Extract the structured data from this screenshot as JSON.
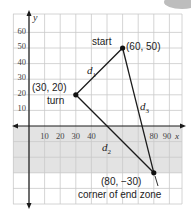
{
  "diagram": {
    "axes": {
      "x_label": "x",
      "y_label": "y",
      "x_ticks": [
        "10",
        "20",
        "30",
        "40",
        "80",
        "90"
      ],
      "y_ticks": [
        "10",
        "20",
        "30",
        "40",
        "50",
        "60"
      ]
    },
    "points": {
      "start": {
        "label": "start",
        "coords": "(60, 50)"
      },
      "turn": {
        "label": "turn",
        "coords": "(30, 20)"
      },
      "corner": {
        "label": "corner of end zone",
        "coords": "(80, −30)"
      }
    },
    "segments": {
      "d1": {
        "letter": "d",
        "sub": "1"
      },
      "d2": {
        "letter": "d",
        "sub": "2"
      },
      "d3": {
        "letter": "d",
        "sub": "3"
      }
    },
    "colors": {
      "grid": "#c8c8c8",
      "shade": "#e2e2e2",
      "line": "#1a1a1a",
      "badge": "#b8b8b8"
    }
  }
}
